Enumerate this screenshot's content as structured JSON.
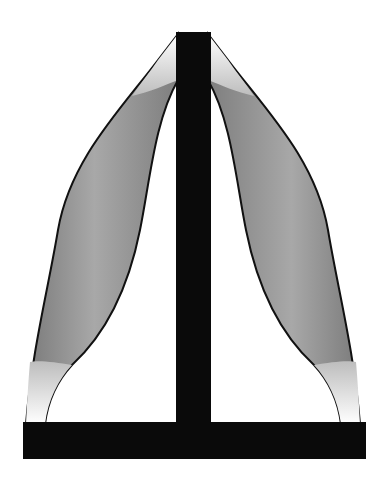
{
  "figure": {
    "colors": {
      "frame": "#0a0a0a",
      "muscle_fill": "#8c8c8c",
      "muscle_light": "#c8c8c8",
      "tendon": "#f2f2f2",
      "outline": "#111111",
      "background": "#ffffff"
    },
    "parts": [
      "vertical-post",
      "base-plate",
      "left-muscle",
      "right-muscle"
    ]
  }
}
